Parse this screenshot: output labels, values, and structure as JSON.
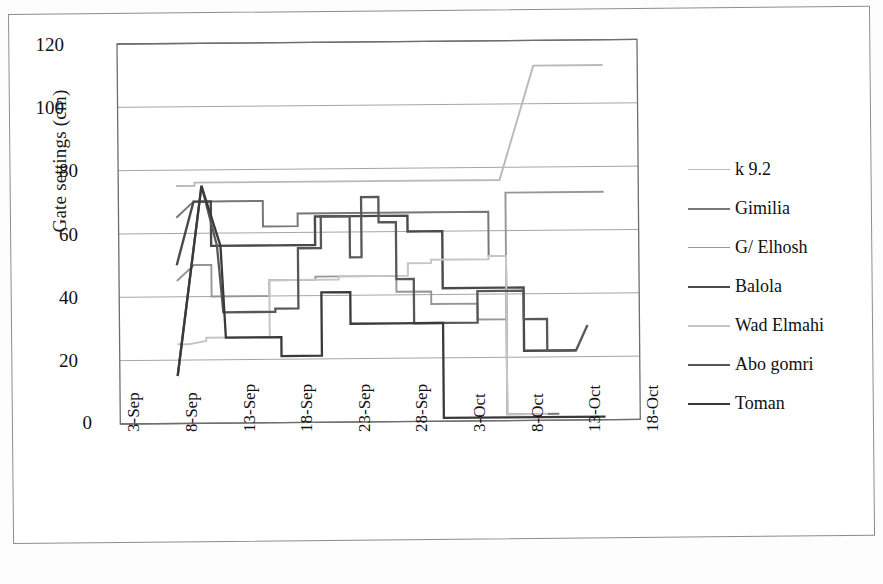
{
  "chart_data": {
    "type": "line",
    "title": "",
    "xlabel": "",
    "ylabel": "Gate settings (cm)",
    "ylim": [
      0,
      120
    ],
    "ytick_labels": [
      "0",
      "20",
      "40",
      "60",
      "80",
      "100",
      "120"
    ],
    "ytick_values": [
      0,
      20,
      40,
      60,
      80,
      100,
      120
    ],
    "x": [
      "3-Sep",
      "8-Sep",
      "13-Sep",
      "18-Sep",
      "23-Sep",
      "28-Sep",
      "3-Oct",
      "8-Oct",
      "13-Oct",
      "18-Oct"
    ],
    "xtick_labels": [
      "3-Sep",
      "8-Sep",
      "13-Sep",
      "18-Sep",
      "23-Sep",
      "28-Sep",
      "3-Oct",
      "8-Oct",
      "13-Oct",
      "18-Oct"
    ],
    "grid": "horizontal",
    "legend_position": "right",
    "series": [
      {
        "name": "k 9.2",
        "color": "#b9b9b9",
        "width": 1.9,
        "points": [
          [
            8.0,
            75
          ],
          [
            9.6,
            75
          ],
          [
            9.6,
            76
          ],
          [
            12.0,
            76
          ],
          [
            12.0,
            76
          ],
          [
            20.0,
            76
          ],
          [
            20.0,
            76
          ],
          [
            27.0,
            76
          ],
          [
            27.0,
            76
          ],
          [
            36.0,
            76
          ],
          [
            36.0,
            76
          ],
          [
            39.0,
            112
          ],
          [
            45.0,
            112
          ]
        ]
      },
      {
        "name": "Gimilia",
        "color": "#777777",
        "width": 2.0,
        "points": [
          [
            8.0,
            65
          ],
          [
            9.5,
            70
          ],
          [
            12.5,
            70
          ],
          [
            15.5,
            70
          ],
          [
            15.5,
            62
          ],
          [
            18.5,
            62
          ],
          [
            18.5,
            66
          ],
          [
            21.0,
            66
          ],
          [
            21.0,
            66
          ],
          [
            30.0,
            66
          ],
          [
            30.0,
            66
          ],
          [
            35.0,
            66
          ],
          [
            35.0,
            52
          ],
          [
            36.5,
            52
          ],
          [
            36.5,
            2
          ],
          [
            41.0,
            2
          ]
        ]
      },
      {
        "name": "G/ Elhosh",
        "color": "#969696",
        "width": 1.9,
        "points": [
          [
            8.0,
            45
          ],
          [
            9.5,
            50
          ],
          [
            11.0,
            50
          ],
          [
            11.0,
            40
          ],
          [
            16.0,
            40
          ],
          [
            16.0,
            45
          ],
          [
            20.0,
            45
          ],
          [
            20.0,
            46
          ],
          [
            27.0,
            46
          ],
          [
            27.0,
            41
          ],
          [
            30.0,
            41
          ],
          [
            30.0,
            37
          ],
          [
            34.0,
            37
          ],
          [
            34.0,
            32
          ],
          [
            36.5,
            32
          ],
          [
            36.5,
            72
          ],
          [
            45.0,
            72
          ]
        ]
      },
      {
        "name": "Balola",
        "color": "#4a4a4a",
        "width": 2.4,
        "points": [
          [
            8.0,
            50
          ],
          [
            9.5,
            70
          ],
          [
            11.0,
            70
          ],
          [
            11.0,
            56
          ],
          [
            16.5,
            56
          ],
          [
            16.5,
            56
          ],
          [
            20.0,
            56
          ],
          [
            20.0,
            65
          ],
          [
            23.5,
            65
          ],
          [
            23.5,
            65
          ],
          [
            28.0,
            65
          ],
          [
            28.0,
            60
          ],
          [
            31.0,
            60
          ],
          [
            31.0,
            42
          ],
          [
            36.0,
            42
          ],
          [
            36.0,
            42
          ],
          [
            38.0,
            42
          ],
          [
            38.0,
            22
          ],
          [
            41.0,
            22
          ],
          [
            41.0,
            22
          ],
          [
            42.5,
            22
          ]
        ]
      },
      {
        "name": "Wad Elmahi",
        "color": "#c6c6c6",
        "width": 2.0,
        "points": [
          [
            8.0,
            25
          ],
          [
            9.0,
            25
          ],
          [
            10.5,
            26
          ],
          [
            10.5,
            27
          ],
          [
            16.0,
            27
          ],
          [
            16.0,
            45
          ],
          [
            22.0,
            45
          ],
          [
            22.0,
            46
          ],
          [
            28.0,
            46
          ],
          [
            28.0,
            50
          ],
          [
            30.0,
            50
          ],
          [
            30.0,
            51
          ],
          [
            35.0,
            51
          ],
          [
            35.0,
            52
          ],
          [
            36.5,
            52
          ],
          [
            36.5,
            2
          ],
          [
            40.0,
            2
          ]
        ]
      },
      {
        "name": "Abo gomri",
        "color": "#585858",
        "width": 2.3,
        "points": [
          [
            8.0,
            15
          ],
          [
            10.2,
            75
          ],
          [
            11.5,
            56
          ],
          [
            12.0,
            35
          ],
          [
            16.5,
            35
          ],
          [
            16.5,
            36
          ],
          [
            18.5,
            36
          ],
          [
            18.5,
            55
          ],
          [
            20.5,
            55
          ],
          [
            20.5,
            65
          ],
          [
            23.0,
            65
          ],
          [
            23.0,
            52
          ],
          [
            24.0,
            52
          ],
          [
            24.0,
            71
          ],
          [
            25.5,
            71
          ],
          [
            25.5,
            63
          ],
          [
            27.0,
            63
          ],
          [
            27.0,
            45
          ],
          [
            28.5,
            45
          ],
          [
            28.5,
            31
          ],
          [
            31.0,
            31
          ],
          [
            31.0,
            31
          ],
          [
            34.0,
            31
          ],
          [
            34.0,
            41
          ],
          [
            36.0,
            41
          ],
          [
            36.0,
            41
          ],
          [
            38.0,
            41
          ],
          [
            38.0,
            32
          ],
          [
            40.0,
            32
          ],
          [
            40.0,
            22
          ],
          [
            42.5,
            22
          ],
          [
            43.5,
            30
          ]
        ]
      },
      {
        "name": "Toman",
        "color": "#3a3a3a",
        "width": 2.3,
        "points": [
          [
            8.0,
            15
          ],
          [
            10.2,
            75
          ],
          [
            11.8,
            56
          ],
          [
            12.2,
            27
          ],
          [
            17.0,
            27
          ],
          [
            17.0,
            21
          ],
          [
            20.5,
            21
          ],
          [
            20.5,
            41
          ],
          [
            23.0,
            41
          ],
          [
            23.0,
            31
          ],
          [
            27.0,
            31
          ],
          [
            27.0,
            31
          ],
          [
            31.0,
            31
          ],
          [
            31.0,
            1
          ],
          [
            45.0,
            1
          ]
        ]
      }
    ]
  },
  "axis": {
    "y_title": "Gate settings (cm)"
  },
  "legend": {
    "items": [
      {
        "label": "k 9.2"
      },
      {
        "label": "Gimilia"
      },
      {
        "label": "G/ Elhosh"
      },
      {
        "label": "Balola"
      },
      {
        "label": "Wad Elmahi"
      },
      {
        "label": "Abo gomri"
      },
      {
        "label": "Toman"
      }
    ]
  },
  "caption": {
    "text": ""
  }
}
